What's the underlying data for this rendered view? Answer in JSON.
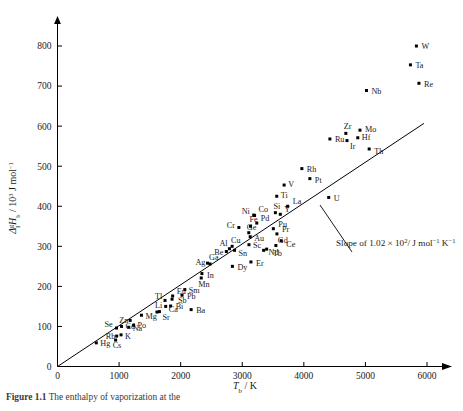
{
  "figure": {
    "caption_label": "Figure",
    "caption_number": "1.1",
    "caption_text": "The enthalpy of vaporization at the"
  },
  "axes": {
    "x": {
      "title_symbol": "T",
      "title_sub": "b",
      "title_unit": "/ K",
      "ticks": [
        "0",
        "1000",
        "2000",
        "3000",
        "4000",
        "5000",
        "6000"
      ],
      "tick_values": [
        0,
        1000,
        2000,
        3000,
        4000,
        5000,
        6000
      ],
      "min": 0,
      "max": 6200
    },
    "y": {
      "title_delta": "Δ",
      "title_sub_l": "l",
      "title_sup_g": "g",
      "title_H": "H",
      "title_H_sub": "b",
      "title_unit": "/ 10",
      "title_unit_sup": "3",
      "title_unit_rest": " J mol",
      "title_unit_sup2": "−1",
      "ticks": [
        "0",
        "100",
        "200",
        "300",
        "400",
        "500",
        "600",
        "700",
        "800"
      ],
      "tick_values": [
        0,
        100,
        200,
        300,
        400,
        500,
        600,
        700,
        800
      ],
      "min": 0,
      "max": 840
    }
  },
  "annotation": {
    "slope_text": "Slope of 1.02 × 10",
    "slope_exp": "2",
    "slope_units": "/ J mol",
    "slope_units_sup1": "−1",
    "slope_units_k": " K",
    "slope_units_sup2": "−1"
  },
  "chart_data": {
    "type": "scatter",
    "title": "",
    "xlabel": "T_b / K",
    "ylabel": "Δ_l^g H_b / 10^3 J mol^-1",
    "xlim": [
      0,
      6200
    ],
    "ylim": [
      0,
      840
    ],
    "grid": false,
    "legend": "none",
    "fit_line": {
      "label": "Slope of 1.02 × 10^2 / J mol^-1 K^-1",
      "slope": 0.102,
      "intercept": 0,
      "x_start": 0,
      "x_end": 5950
    },
    "points": [
      {
        "label": "Hg",
        "x": 630,
        "y": 59,
        "label_dx": 4,
        "label_dy": 3
      },
      {
        "label": "Cs",
        "x": 944,
        "y": 66,
        "label_dx": -3,
        "label_dy": 8
      },
      {
        "label": "Rb",
        "x": 961,
        "y": 76,
        "label_dx": -11,
        "label_dy": 3
      },
      {
        "label": "K",
        "x": 1032,
        "y": 79,
        "label_dx": 4,
        "label_dy": 4
      },
      {
        "label": "Na",
        "x": 1156,
        "y": 98,
        "label_dx": 4,
        "label_dy": 4
      },
      {
        "label": "Cd",
        "x": 1040,
        "y": 100,
        "label_dx": 4,
        "label_dy": 3
      },
      {
        "label": "Se",
        "x": 958,
        "y": 96,
        "label_dx": -12,
        "label_dy": -1
      },
      {
        "label": "Po",
        "x": 1235,
        "y": 103,
        "label_dx": 4,
        "label_dy": 3
      },
      {
        "label": "Zn",
        "x": 1180,
        "y": 115,
        "label_dx": -11,
        "label_dy": 0
      },
      {
        "label": "Mg",
        "x": 1363,
        "y": 128,
        "label_dx": 4,
        "label_dy": 4
      },
      {
        "label": "Li",
        "x": 1615,
        "y": 136,
        "label_dx": -2,
        "label_dy": -4
      },
      {
        "label": "Sr",
        "x": 1655,
        "y": 137,
        "label_dx": 3,
        "label_dy": 8
      },
      {
        "label": "Ca",
        "x": 1757,
        "y": 150,
        "label_dx": 3,
        "label_dy": 6
      },
      {
        "label": "Bi",
        "x": 1837,
        "y": 151,
        "label_dx": 5,
        "label_dy": 3
      },
      {
        "label": "Tl",
        "x": 1746,
        "y": 165,
        "label_dx": -10,
        "label_dy": -1
      },
      {
        "label": "Eu",
        "x": 1870,
        "y": 176,
        "label_dx": 4,
        "label_dy": -2
      },
      {
        "label": "Sb",
        "x": 1860,
        "y": 168,
        "label_dx": 6,
        "label_dy": 4
      },
      {
        "label": "Pb",
        "x": 2022,
        "y": 178,
        "label_dx": 5,
        "label_dy": 4
      },
      {
        "label": "Sm",
        "x": 2067,
        "y": 192,
        "label_dx": 4,
        "label_dy": 3
      },
      {
        "label": "Mn",
        "x": 2334,
        "y": 221,
        "label_dx": -3,
        "label_dy": 9
      },
      {
        "label": "Ba",
        "x": 2170,
        "y": 142,
        "label_dx": 5,
        "label_dy": 3
      },
      {
        "label": "In",
        "x": 2345,
        "y": 232,
        "label_dx": 5,
        "label_dy": 4
      },
      {
        "label": "Ag",
        "x": 2435,
        "y": 258,
        "label_dx": -12,
        "label_dy": 2
      },
      {
        "label": "Ga",
        "x": 2477,
        "y": 256,
        "label_dx": -1,
        "label_dy": -4
      },
      {
        "label": "Dy",
        "x": 2840,
        "y": 250,
        "label_dx": 5,
        "label_dy": 4
      },
      {
        "label": "Er",
        "x": 3141,
        "y": 261,
        "label_dx": 5,
        "label_dy": 4
      },
      {
        "label": "Be",
        "x": 2742,
        "y": 287,
        "label_dx": -12,
        "label_dy": 3
      },
      {
        "label": "Al",
        "x": 2792,
        "y": 294,
        "label_dx": -10,
        "label_dy": -3
      },
      {
        "label": "Cu",
        "x": 2835,
        "y": 300,
        "label_dx": -1,
        "label_dy": -3
      },
      {
        "label": "Sn",
        "x": 2875,
        "y": 290,
        "label_dx": 4,
        "label_dy": 6
      },
      {
        "label": "Sc",
        "x": 3109,
        "y": 304,
        "label_dx": 4,
        "label_dy": 3
      },
      {
        "label": "Nd",
        "x": 3347,
        "y": 290,
        "label_dx": 5,
        "label_dy": 5
      },
      {
        "label": "Tb",
        "x": 3396,
        "y": 293,
        "label_dx": 6,
        "label_dy": 7
      },
      {
        "label": "Ge",
        "x": 3106,
        "y": 334,
        "label_dx": -2,
        "label_dy": -3
      },
      {
        "label": "Au",
        "x": 3129,
        "y": 324,
        "label_dx": 4,
        "label_dy": 4
      },
      {
        "label": "Gd",
        "x": 3546,
        "y": 302,
        "label_dx": 2,
        "label_dy": -3
      },
      {
        "label": "Ce",
        "x": 3633,
        "y": 314,
        "label_dx": 5,
        "label_dy": 6
      },
      {
        "label": "Pr",
        "x": 3563,
        "y": 331,
        "label_dx": 5,
        "label_dy": -2
      },
      {
        "label": "Pu",
        "x": 3505,
        "y": 344,
        "label_dx": 5,
        "label_dy": -2
      },
      {
        "label": "Pd",
        "x": 3236,
        "y": 358,
        "label_dx": 4,
        "label_dy": -2
      },
      {
        "label": "Fe",
        "x": 3134,
        "y": 350,
        "label_dx": -1,
        "label_dy": -4
      },
      {
        "label": "Cr",
        "x": 2945,
        "y": 347,
        "label_dx": -12,
        "label_dy": 1
      },
      {
        "label": "Co",
        "x": 3200,
        "y": 377,
        "label_dx": 4,
        "label_dy": -3
      },
      {
        "label": "Ni",
        "x": 3186,
        "y": 378,
        "label_dx": -12,
        "label_dy": -1
      },
      {
        "label": "Si",
        "x": 3538,
        "y": 384,
        "label_dx": -2,
        "label_dy": -4
      },
      {
        "label": "Y",
        "x": 3618,
        "y": 380,
        "label_dx": 4,
        "label_dy": -2
      },
      {
        "label": "La",
        "x": 3737,
        "y": 400,
        "label_dx": 5,
        "label_dy": -2
      },
      {
        "label": "Ti",
        "x": 3560,
        "y": 425,
        "label_dx": 4,
        "label_dy": 2
      },
      {
        "label": "V",
        "x": 3680,
        "y": 453,
        "label_dx": 4,
        "label_dy": 2
      },
      {
        "label": "Rh",
        "x": 3968,
        "y": 494,
        "label_dx": 5,
        "label_dy": 3
      },
      {
        "label": "Pt",
        "x": 4098,
        "y": 469,
        "label_dx": 5,
        "label_dy": 4
      },
      {
        "label": "U",
        "x": 4404,
        "y": 422,
        "label_dx": 5,
        "label_dy": 4
      },
      {
        "label": "Ru",
        "x": 4423,
        "y": 568,
        "label_dx": 5,
        "label_dy": 3
      },
      {
        "label": "Ir",
        "x": 4701,
        "y": 564,
        "label_dx": 3,
        "label_dy": 8
      },
      {
        "label": "Zr",
        "x": 4682,
        "y": 582,
        "label_dx": -2,
        "label_dy": -4
      },
      {
        "label": "Hf",
        "x": 4876,
        "y": 571,
        "label_dx": 4,
        "label_dy": 2
      },
      {
        "label": "Mo",
        "x": 4912,
        "y": 590,
        "label_dx": 5,
        "label_dy": 2
      },
      {
        "label": "Th",
        "x": 5061,
        "y": 543,
        "label_dx": 5,
        "label_dy": 5
      },
      {
        "label": "Nb",
        "x": 5017,
        "y": 689,
        "label_dx": 5,
        "label_dy": 4
      },
      {
        "label": "Re",
        "x": 5869,
        "y": 707,
        "label_dx": 5,
        "label_dy": 4
      },
      {
        "label": "Ta",
        "x": 5731,
        "y": 753,
        "label_dx": 5,
        "label_dy": 3
      },
      {
        "label": "W",
        "x": 5828,
        "y": 800,
        "label_dx": 5,
        "label_dy": 3
      }
    ]
  }
}
